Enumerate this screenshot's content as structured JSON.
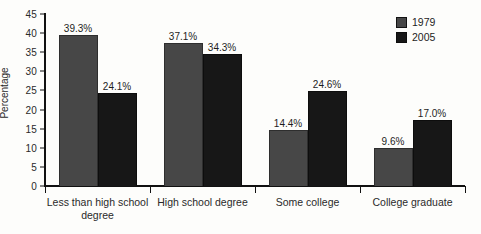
{
  "chart_data": {
    "type": "bar",
    "title": "",
    "subtitle": "",
    "xlabel": "",
    "ylabel": "Percentage",
    "ylim": [
      0,
      45
    ],
    "ytick_step": 5,
    "yticks": [
      "45",
      "40",
      "35",
      "30",
      "25",
      "20",
      "15",
      "10",
      "5",
      "0"
    ],
    "grid": false,
    "legend_position": "top-right",
    "categories": [
      "Less than high school degree",
      "High school degree",
      "Some college",
      "College graduate"
    ],
    "series": [
      {
        "name": "1979",
        "color": "#474747",
        "values": [
          39.3,
          37.1,
          14.4,
          9.6
        ],
        "labels": [
          "39.3%",
          "37.1%",
          "14.4%",
          "9.6%"
        ]
      },
      {
        "name": "2005",
        "color": "#171717",
        "values": [
          24.1,
          34.3,
          24.6,
          17.0
        ],
        "labels": [
          "24.1%",
          "34.3%",
          "24.6%",
          "17.0%"
        ]
      }
    ]
  },
  "legend": {
    "items": [
      {
        "label": "1979",
        "swatch": "legend-swatch-1979"
      },
      {
        "label": "2005",
        "swatch": "legend-swatch-2005"
      }
    ]
  }
}
